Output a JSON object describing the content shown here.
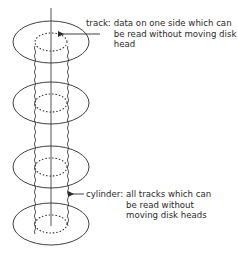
{
  "diagram": {
    "type": "disk-pack-structure",
    "colors": {
      "background": "#ffffff",
      "stroke": "#2a2a2a",
      "text": "#2a2a2a"
    },
    "platters": [
      {
        "id": "platter-1",
        "cx": 51,
        "cy": 42
      },
      {
        "id": "platter-2",
        "cx": 51,
        "cy": 103
      },
      {
        "id": "platter-3",
        "cx": 51,
        "cy": 167
      },
      {
        "id": "platter-4",
        "cx": 51,
        "cy": 224
      }
    ],
    "annotations": {
      "track": {
        "term": "track:",
        "lines": [
          "data on one side which can",
          "be read without moving disk",
          "head"
        ]
      },
      "cylinder": {
        "term": "cylinder:",
        "lines": [
          "all tracks which can",
          "be read without",
          "moving disk heads"
        ]
      }
    }
  }
}
